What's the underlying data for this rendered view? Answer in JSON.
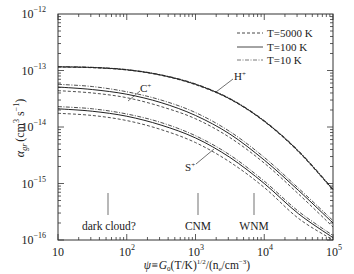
{
  "chart_data": {
    "type": "line",
    "title": "",
    "xlabel": "ψ ≡ G0 (T/K)^1/2 / (ne/cm^-3)",
    "ylabel": "α_gr (cm^3 s^-1)",
    "xscale": "log",
    "yscale": "log",
    "xlim": [
      10,
      100000
    ],
    "ylim": [
      1e-16,
      1e-12
    ],
    "x_ticks": [
      "10",
      "10^2",
      "10^3",
      "10^4",
      "10^5"
    ],
    "y_ticks": [
      "10^-16",
      "10^-15",
      "10^-14",
      "10^-13",
      "10^-12"
    ],
    "legend": {
      "position": "upper right",
      "entries": [
        {
          "label": "T=5000 K",
          "style": "dashed"
        },
        {
          "label": "T=100 K",
          "style": "solid"
        },
        {
          "label": "T=10 K",
          "style": "dash-dot"
        }
      ]
    },
    "x": [
      10,
      31.6,
      100,
      316,
      1000,
      3162,
      10000,
      31623,
      100000
    ],
    "series": [
      {
        "name": "H+ T=5000 K",
        "ion": "H+",
        "style": "dashed",
        "values": [
          1.15e-13,
          1.12e-13,
          1.02e-13,
          8.2e-14,
          5.6e-14,
          3.1e-14,
          1.25e-14,
          3.6e-15,
          7.6e-16
        ]
      },
      {
        "name": "H+ T=100 K",
        "ion": "H+",
        "style": "solid",
        "values": [
          1.16e-13,
          1.13e-13,
          1.03e-13,
          8.3e-14,
          5.7e-14,
          3.15e-14,
          1.27e-14,
          3.7e-15,
          7.8e-16
        ]
      },
      {
        "name": "H+ T=10 K",
        "ion": "H+",
        "style": "dash-dot",
        "values": [
          1.17e-13,
          1.14e-13,
          1.04e-13,
          8.4e-14,
          5.8e-14,
          3.2e-14,
          1.3e-14,
          3.8e-15,
          8e-16
        ]
      },
      {
        "name": "C+ T=5000 K",
        "ion": "C+",
        "style": "dashed",
        "values": [
          4.4e-14,
          4e-14,
          3.3e-14,
          2.3e-14,
          1.4e-14,
          6.5e-15,
          2.3e-15,
          6.5e-16,
          1.7e-16
        ]
      },
      {
        "name": "C+ T=100 K",
        "ion": "C+",
        "style": "solid",
        "values": [
          5.1e-14,
          4.6e-14,
          3.8e-14,
          2.7e-14,
          1.6e-14,
          7.5e-15,
          2.6e-15,
          7.5e-16,
          2e-16
        ]
      },
      {
        "name": "C+ T=10 K",
        "ion": "C+",
        "style": "dash-dot",
        "values": [
          5.7e-14,
          5.2e-14,
          4.2e-14,
          3e-14,
          1.8e-14,
          8.3e-15,
          2.9e-15,
          8.2e-16,
          2.2e-16
        ]
      },
      {
        "name": "S+ T=5000 K",
        "ion": "S+",
        "style": "dashed",
        "values": [
          1.75e-14,
          1.6e-14,
          1.3e-14,
          9e-15,
          5.3e-15,
          2.4e-15,
          8.5e-16,
          2.4e-16,
          1e-16
        ]
      },
      {
        "name": "S+ T=100 K",
        "ion": "S+",
        "style": "solid",
        "values": [
          2.1e-14,
          1.9e-14,
          1.55e-14,
          1.08e-14,
          6.4e-15,
          2.9e-15,
          1e-15,
          2.9e-16,
          1.1e-16
        ]
      },
      {
        "name": "S+ T=10 K",
        "ion": "S+",
        "style": "dash-dot",
        "values": [
          2.3e-14,
          2.1e-14,
          1.7e-14,
          1.2e-14,
          7e-15,
          3.2e-15,
          1.1e-15,
          3.2e-16,
          1.2e-16
        ]
      }
    ],
    "annotations": [
      {
        "text": "H+",
        "type": "curve-label"
      },
      {
        "text": "C+",
        "type": "curve-label"
      },
      {
        "text": "S+",
        "type": "curve-label"
      },
      {
        "text": "dark cloud?",
        "x": 50,
        "type": "vertical-marker"
      },
      {
        "text": "CNM",
        "x": 1000,
        "type": "vertical-marker"
      },
      {
        "text": "WNM",
        "x": 6600,
        "type": "vertical-marker"
      }
    ],
    "grid": false
  },
  "labels": {
    "ylabel_main": "α",
    "ylabel_sub": "gr",
    "ylabel_unit": "(cm",
    "ylabel_unit_sup": "3",
    "ylabel_unit2": " s",
    "ylabel_unit2_sup": "−1",
    "ylabel_close": ")",
    "xlabel_a": "ψ≡G",
    "xlabel_a_sub": "0",
    "xlabel_b": "(T/K)",
    "xlabel_b_sup": "1/2",
    "xlabel_c": "/(n",
    "xlabel_c_sub": "e",
    "xlabel_d": "/cm",
    "xlabel_d_sup": "−3",
    "xlabel_e": ")",
    "xtick_10": "10",
    "xtick_base": "10",
    "xtick_2": "2",
    "xtick_3": "3",
    "xtick_4": "4",
    "xtick_5": "5",
    "ytick_base": "10",
    "ytick_m16": "−16",
    "ytick_m15": "−15",
    "ytick_m14": "−14",
    "ytick_m13": "−13",
    "ytick_m12": "−12",
    "legend_5000": "T=5000 K",
    "legend_100": "T=100 K",
    "legend_10": "T=10 K",
    "label_H": "H",
    "label_C": "C",
    "label_S": "S",
    "plus": "+",
    "marker_dark": "dark cloud?",
    "marker_cnm": "CNM",
    "marker_wnm": "WNM"
  }
}
